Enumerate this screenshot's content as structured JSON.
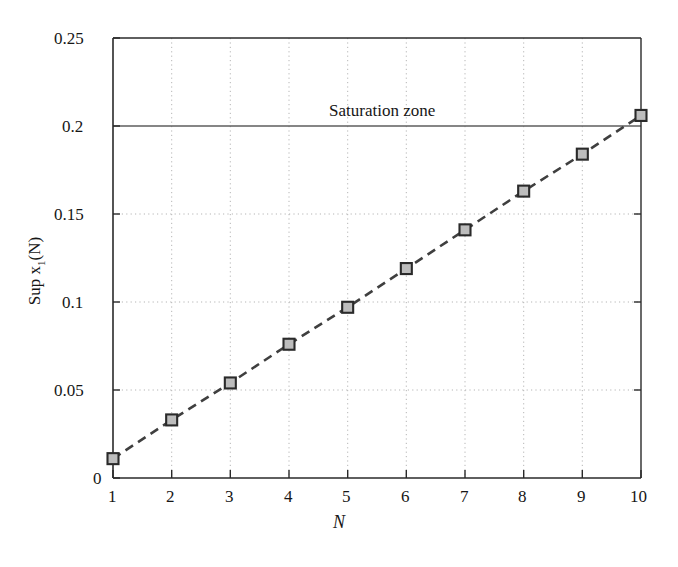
{
  "chart_data": {
    "type": "line",
    "title": "",
    "xlabel": "N",
    "ylabel": "Sup x1(N)",
    "ylabel_parts": {
      "prefix": "Sup x",
      "sub": "1",
      "suffix": "(N)"
    },
    "x": [
      1,
      2,
      3,
      4,
      5,
      6,
      7,
      8,
      9,
      10
    ],
    "values": [
      0.011,
      0.033,
      0.054,
      0.076,
      0.097,
      0.119,
      0.141,
      0.163,
      0.184,
      0.206
    ],
    "series": [
      {
        "name": "Sup x1(N)",
        "values": [
          0.011,
          0.033,
          0.054,
          0.076,
          0.097,
          0.119,
          0.141,
          0.163,
          0.184,
          0.206
        ],
        "line_style": "dashed",
        "line_color": "#3f3f3f",
        "marker": "square",
        "marker_face_color": "#bdbdbd",
        "marker_edge_color": "#2a2a2a"
      }
    ],
    "xlim": [
      1,
      10
    ],
    "ylim": [
      0,
      0.25
    ],
    "xticks": [
      1,
      2,
      3,
      4,
      5,
      6,
      7,
      8,
      9,
      10
    ],
    "xticklabels": [
      "1",
      "2",
      "3",
      "4",
      "5",
      "6",
      "7",
      "8",
      "9",
      "10"
    ],
    "yticks": [
      0,
      0.05,
      0.1,
      0.15,
      0.2,
      0.25
    ],
    "yticklabels": [
      "0",
      "0.05",
      "0.1",
      "0.15",
      "0.2",
      "0.25"
    ],
    "grid": true,
    "grid_style": "dotted",
    "grid_color": "#b5b5b5",
    "legend": null,
    "annotations": [
      {
        "text": "Saturation zone",
        "x": 4.35,
        "y": 0.214,
        "kind": "text-label"
      }
    ],
    "reference_lines": [
      {
        "name": "saturation-threshold",
        "orientation": "horizontal",
        "y": 0.2,
        "color": "#5e5e5e",
        "style": "solid"
      }
    ],
    "axis_color": "#2a2a2a",
    "background_color": "#ffffff"
  }
}
